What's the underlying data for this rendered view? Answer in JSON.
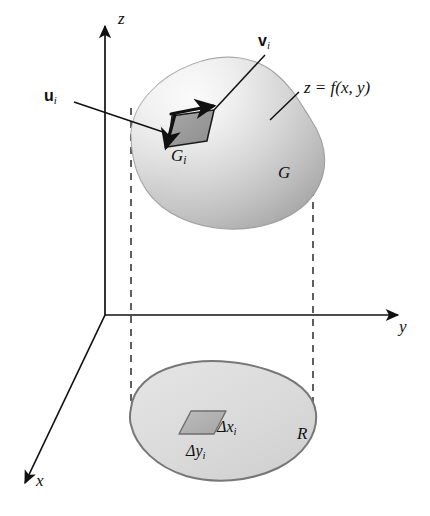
{
  "figure": {
    "kind": "3d-surface-over-planar-region",
    "background_color": "#ffffff",
    "ink_color": "#111111",
    "axes": {
      "z_label": "z",
      "y_label": "y",
      "x_label": "x",
      "origin": [
        105,
        315
      ]
    },
    "surface": {
      "name_label": "G",
      "equation_label": "z = f(x, y)",
      "patch_label_base": "G",
      "patch_label_sub": "i",
      "fill_light": "#f2f2f2",
      "fill_mid": "#c9c9c9",
      "fill_dark": "#9a9a9a",
      "outline_color": "#8a8a8a"
    },
    "vectors": {
      "u_label_base": "u",
      "u_label_sub": "i",
      "v_label_base": "v",
      "v_label_sub": "i"
    },
    "region": {
      "name_label": "R",
      "fill_color": "#dcdcdc",
      "outline_color": "#777777",
      "delta_x_label_base": "Δx",
      "delta_x_label_sub": "i",
      "delta_y_label_base": "Δy",
      "delta_y_label_sub": "i",
      "cell_fill": "#b3b3b3",
      "cell_outline": "#6e6e6e"
    },
    "projection_lines": {
      "style": "dashed",
      "color": "#444444",
      "left_x": 131,
      "right_x": 313
    }
  }
}
